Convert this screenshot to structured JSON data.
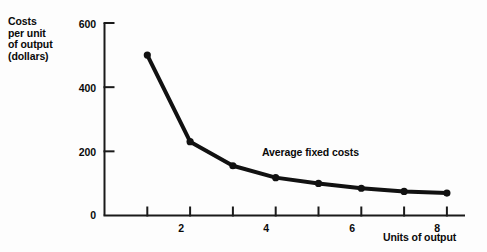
{
  "chart_data": {
    "type": "line",
    "title": "",
    "subtitle": "",
    "xlabel": "Units of output",
    "ylabel": "Costs per unit of output (dollars)",
    "ylabel_lines": [
      "Costs",
      "per unit",
      "of output",
      "(dollars)"
    ],
    "x": [
      1,
      2,
      3,
      4,
      5,
      6,
      7,
      8
    ],
    "values": [
      500,
      230,
      155,
      118,
      100,
      85,
      75,
      70
    ],
    "series": [
      {
        "name": "Average fixed costs",
        "values": [
          500,
          230,
          155,
          118,
          100,
          85,
          75,
          70
        ]
      }
    ],
    "annotations": [
      {
        "text": "Average fixed costs",
        "x": 5.5,
        "y": 175
      }
    ],
    "xlim": [
      0,
      8.6
    ],
    "ylim": [
      0,
      600
    ],
    "xticks": [
      1,
      2,
      3,
      4,
      5,
      6,
      7,
      8
    ],
    "xtick_labels": [
      "",
      "2",
      "",
      "4",
      "",
      "6",
      "",
      "8"
    ],
    "yticks": [
      0,
      200,
      400,
      600
    ],
    "ytick_labels": [
      "0",
      "200",
      "400",
      "600"
    ],
    "grid": false,
    "legend": "none",
    "line_color": "#111111",
    "marker_color": "#111111",
    "axis_color": "#1a1a1a",
    "background_color": "#fdfdfd"
  }
}
